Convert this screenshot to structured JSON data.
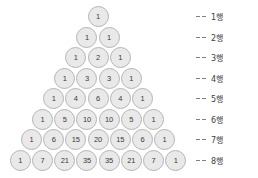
{
  "figure": {
    "colors": {
      "circle_fill": "#e9e9e9",
      "circle_border": "#b4b4b4",
      "number_text": "#3a3a3a",
      "label_text": "#404040",
      "dash_line": "#808080",
      "background": "#ffffff"
    }
  },
  "chart_data": {
    "type": "table",
    "xlabel": "",
    "ylabel": "",
    "rows": [
      {
        "label": "1행",
        "values": [
          1
        ]
      },
      {
        "label": "2행",
        "values": [
          1,
          1
        ]
      },
      {
        "label": "3행",
        "values": [
          1,
          2,
          1
        ]
      },
      {
        "label": "4행",
        "values": [
          1,
          3,
          3,
          1
        ]
      },
      {
        "label": "5행",
        "values": [
          1,
          4,
          6,
          4,
          1
        ]
      },
      {
        "label": "6행",
        "values": [
          1,
          5,
          10,
          10,
          5,
          1
        ]
      },
      {
        "label": "7행",
        "values": [
          1,
          6,
          15,
          20,
          15,
          6,
          1
        ]
      },
      {
        "label": "8행",
        "values": [
          1,
          7,
          21,
          35,
          35,
          21,
          7,
          1
        ]
      }
    ]
  }
}
